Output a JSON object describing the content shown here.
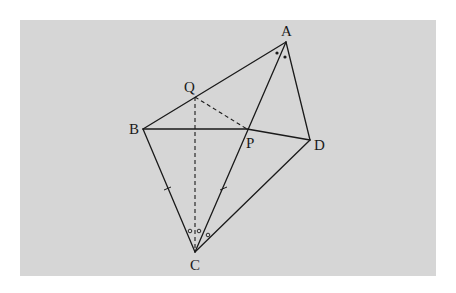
{
  "diagram": {
    "background_color": "#d6d6d6",
    "line_color": "#1a1a1a",
    "points": [
      {
        "id": "A",
        "label": "A"
      },
      {
        "id": "B",
        "label": "B"
      },
      {
        "id": "C",
        "label": "C"
      },
      {
        "id": "D",
        "label": "D"
      },
      {
        "id": "P",
        "label": "P"
      },
      {
        "id": "Q",
        "label": "Q"
      }
    ],
    "solid_segments": [
      "AB",
      "AD",
      "AC",
      "BP",
      "PD",
      "BC",
      "CD"
    ],
    "dashed_segments": [
      "QC",
      "QP"
    ],
    "markings": {
      "equal_length_ticks": [
        "BC",
        "PC"
      ],
      "equal_angles_at_A": "two dots (angle BAC = angle CAD)",
      "equal_angles_at_C": "three circles (angles BCQ, QCA, ACD equal)"
    }
  }
}
